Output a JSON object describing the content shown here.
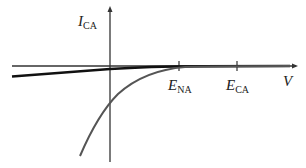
{
  "diagram": {
    "y_axis_label": {
      "main": "I",
      "sub": "CA"
    },
    "x_axis_label": "V",
    "ticks": [
      {
        "main": "E",
        "sub": "NA",
        "x": 179
      },
      {
        "main": "E",
        "sub": "CA",
        "x": 237
      }
    ],
    "colors": {
      "axis": "#333333",
      "dark_curve": "#111111",
      "gray_curve": "#555555"
    }
  }
}
